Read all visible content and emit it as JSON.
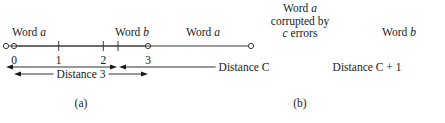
{
  "figure": {
    "panel_a": {
      "caption": "(a)",
      "left_endpoint_label_prefix": "Word ",
      "left_endpoint_label_var": "a",
      "right_endpoint_label_prefix": "Word ",
      "right_endpoint_label_var": "b",
      "tick_labels": [
        "0",
        "1",
        "2",
        "3"
      ],
      "distance_label": "Distance 3",
      "axis": {
        "x_start": 14,
        "x_end": 148,
        "y": 46,
        "tick_positions": [
          14,
          58.7,
          103.3,
          148
        ]
      },
      "distance_bar": {
        "x_start": 14,
        "x_end": 148,
        "y": 74
      }
    },
    "panel_b": {
      "caption": "(b)",
      "left_endpoint_label_prefix": "Word ",
      "left_endpoint_label_var": "a",
      "right_endpoint_label_prefix": "Word ",
      "right_endpoint_label_var": "b",
      "center_label_line1_prefix": "Word ",
      "center_label_line1_var": "a",
      "center_label_line2": "corrupted by",
      "center_label_line3_var": "c",
      "center_label_line3_suffix": " errors",
      "left_distance_label": "Distance C",
      "right_distance_label": "Distance C + 1",
      "axis": {
        "x_start": 188,
        "x_end": 433,
        "y": 46,
        "tick_positions": [
          300
        ]
      },
      "distance_bar": {
        "x_start": 188,
        "x_mid": 300,
        "x_end": 433,
        "y": 67
      }
    }
  },
  "colors": {
    "background": "#ffffff",
    "ink": "#1a1a1a",
    "line": "#3a3a3a"
  }
}
